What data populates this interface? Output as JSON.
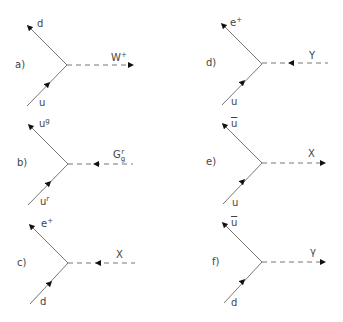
{
  "figure": {
    "colors": {
      "line": "#777777",
      "text": "#444444",
      "arrow": "#111111"
    },
    "panels": [
      {
        "id": "a",
        "label": "a)",
        "top_particle": "d",
        "bottom_particle": "u",
        "boson": {
          "base": "W",
          "sup": "+",
          "sub": ""
        },
        "boson_arrow": "outgoing"
      },
      {
        "id": "b",
        "label": "b)",
        "top_particle": {
          "base": "u",
          "sup": "g"
        },
        "bottom_particle": {
          "base": "u",
          "sup": "r"
        },
        "boson": {
          "base": "G",
          "sup": "r",
          "sub": "g"
        },
        "boson_arrow": "incoming"
      },
      {
        "id": "c",
        "label": "c)",
        "top_particle": {
          "base": "e",
          "sup": "+"
        },
        "bottom_particle": "d",
        "boson": {
          "base": "X",
          "sup": "",
          "sub": ""
        },
        "boson_arrow": "incoming"
      },
      {
        "id": "d",
        "label": "d)",
        "top_particle": {
          "base": "e",
          "sup": "+"
        },
        "bottom_particle": "u",
        "boson": {
          "base": "Y",
          "sup": "",
          "sub": ""
        },
        "boson_arrow": "incoming"
      },
      {
        "id": "e",
        "label": "e)",
        "top_particle": {
          "base": "u",
          "bar": true
        },
        "bottom_particle": "u",
        "boson": {
          "base": "X",
          "sup": "",
          "sub": ""
        },
        "boson_arrow": "outgoing"
      },
      {
        "id": "f",
        "label": "f)",
        "top_particle": {
          "base": "u",
          "bar": true
        },
        "bottom_particle": "d",
        "boson": {
          "base": "γ",
          "sup": "",
          "sub": ""
        },
        "boson_arrow": "outgoing"
      }
    ]
  }
}
